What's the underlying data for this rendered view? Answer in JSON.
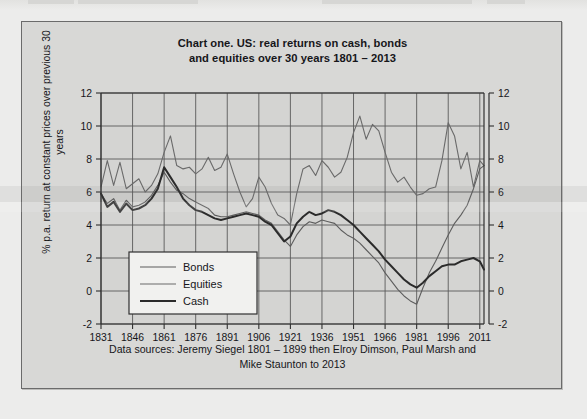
{
  "figure": {
    "title_line1": "Chart one. US: real returns on cash, bonds",
    "title_line2": "and equities  over 30 years 1801 – 2013",
    "caption_line1": "Data sources: Jeremy Siegel 1801 – 1899 then Elroy Dimson, Paul Marsh and",
    "caption_line2": "Mike Staunton to 2013",
    "panel_bg": "#d8d8d6",
    "border_color": "#6b6b6b"
  },
  "chart_data": {
    "type": "line",
    "title": "Chart one. US: real returns on cash, bonds and equities  over 30 years 1801 – 2013",
    "xlabel": "",
    "ylabel": "% p.a. return at constant prices over previous 30 years",
    "xlim": [
      1831,
      2013
    ],
    "ylim": [
      -2,
      12
    ],
    "xticks": [
      1831,
      1846,
      1861,
      1876,
      1891,
      1906,
      1921,
      1936,
      1951,
      1966,
      1981,
      1996,
      2011
    ],
    "yticks": [
      -2,
      0,
      2,
      4,
      6,
      8,
      10,
      12
    ],
    "grid": true,
    "right_axis_mirror": true,
    "legend_position": "lower-left-inside",
    "series": [
      {
        "name": "Bonds",
        "color": "#5d5d5d",
        "width": 1.1,
        "x": [
          1831,
          1834,
          1837,
          1840,
          1843,
          1846,
          1849,
          1852,
          1855,
          1858,
          1861,
          1864,
          1867,
          1870,
          1873,
          1876,
          1879,
          1882,
          1885,
          1888,
          1891,
          1894,
          1897,
          1900,
          1903,
          1906,
          1909,
          1912,
          1915,
          1918,
          1921,
          1924,
          1927,
          1930,
          1933,
          1936,
          1939,
          1942,
          1945,
          1948,
          1951,
          1954,
          1957,
          1960,
          1963,
          1966,
          1969,
          1972,
          1975,
          1978,
          1981,
          1984,
          1987,
          1990,
          1993,
          1996,
          1999,
          2002,
          2005,
          2008,
          2011,
          2013
        ],
        "y": [
          5.9,
          5.3,
          5.6,
          4.9,
          5.5,
          5.1,
          5.2,
          5.4,
          5.8,
          6.4,
          7.2,
          6.6,
          6.1,
          5.9,
          5.6,
          5.4,
          5.2,
          5.0,
          4.6,
          4.5,
          4.5,
          4.6,
          4.7,
          4.8,
          4.7,
          4.6,
          4.3,
          4.1,
          3.6,
          3.1,
          2.7,
          3.4,
          3.9,
          4.2,
          4.1,
          4.3,
          4.2,
          4.1,
          3.7,
          3.4,
          3.2,
          2.9,
          2.5,
          2.1,
          1.7,
          1.1,
          0.6,
          0.1,
          -0.3,
          -0.6,
          -0.8,
          0.2,
          1.1,
          1.8,
          2.6,
          3.4,
          4.1,
          4.6,
          5.2,
          6.2,
          7.4,
          7.6
        ]
      },
      {
        "name": "Equities",
        "color": "#6a6a6a",
        "width": 1.1,
        "x": [
          1831,
          1834,
          1837,
          1840,
          1843,
          1846,
          1849,
          1852,
          1855,
          1858,
          1861,
          1864,
          1867,
          1870,
          1873,
          1876,
          1879,
          1882,
          1885,
          1888,
          1891,
          1894,
          1897,
          1900,
          1903,
          1906,
          1909,
          1912,
          1915,
          1918,
          1921,
          1924,
          1927,
          1930,
          1933,
          1936,
          1939,
          1942,
          1945,
          1948,
          1951,
          1954,
          1957,
          1960,
          1963,
          1966,
          1969,
          1972,
          1975,
          1978,
          1981,
          1984,
          1987,
          1990,
          1993,
          1996,
          1999,
          2002,
          2005,
          2008,
          2011,
          2013
        ],
        "y": [
          6.3,
          7.9,
          6.4,
          7.8,
          6.2,
          6.5,
          6.8,
          6.0,
          6.4,
          7.1,
          8.4,
          9.4,
          7.6,
          7.4,
          7.5,
          7.1,
          7.4,
          8.1,
          7.3,
          7.5,
          8.3,
          7.1,
          6.0,
          5.1,
          5.6,
          6.9,
          6.3,
          5.3,
          4.6,
          4.4,
          4.0,
          5.9,
          7.4,
          7.6,
          7.0,
          7.9,
          7.5,
          6.9,
          7.2,
          8.1,
          9.6,
          10.6,
          9.2,
          10.1,
          9.7,
          8.4,
          7.2,
          6.6,
          6.9,
          6.3,
          5.8,
          5.9,
          6.2,
          6.3,
          7.9,
          10.2,
          9.4,
          7.4,
          8.4,
          6.3,
          7.9,
          7.6
        ]
      },
      {
        "name": "Cash",
        "color": "#2b2b2b",
        "width": 2.0,
        "x": [
          1831,
          1834,
          1837,
          1840,
          1843,
          1846,
          1849,
          1852,
          1855,
          1858,
          1861,
          1864,
          1867,
          1870,
          1873,
          1876,
          1879,
          1882,
          1885,
          1888,
          1891,
          1894,
          1897,
          1900,
          1903,
          1906,
          1909,
          1912,
          1915,
          1918,
          1921,
          1924,
          1927,
          1930,
          1933,
          1936,
          1939,
          1942,
          1945,
          1948,
          1951,
          1954,
          1957,
          1960,
          1963,
          1966,
          1969,
          1972,
          1975,
          1978,
          1981,
          1984,
          1987,
          1990,
          1993,
          1996,
          1999,
          2002,
          2005,
          2008,
          2011,
          2013
        ],
        "y": [
          5.9,
          5.1,
          5.4,
          4.8,
          5.3,
          4.9,
          5.0,
          5.2,
          5.6,
          6.2,
          7.5,
          6.9,
          6.3,
          5.6,
          5.2,
          4.9,
          4.8,
          4.6,
          4.4,
          4.3,
          4.4,
          4.5,
          4.6,
          4.7,
          4.6,
          4.5,
          4.2,
          4.0,
          3.5,
          3.0,
          3.3,
          4.1,
          4.5,
          4.8,
          4.6,
          4.7,
          4.9,
          4.8,
          4.6,
          4.3,
          4.0,
          3.6,
          3.2,
          2.8,
          2.4,
          1.9,
          1.5,
          1.1,
          0.7,
          0.4,
          0.2,
          0.5,
          0.9,
          1.2,
          1.5,
          1.6,
          1.6,
          1.8,
          1.9,
          2.0,
          1.8,
          1.3
        ]
      }
    ]
  },
  "legend": {
    "items": [
      {
        "label": "Bonds"
      },
      {
        "label": "Equities"
      },
      {
        "label": "Cash"
      }
    ]
  }
}
